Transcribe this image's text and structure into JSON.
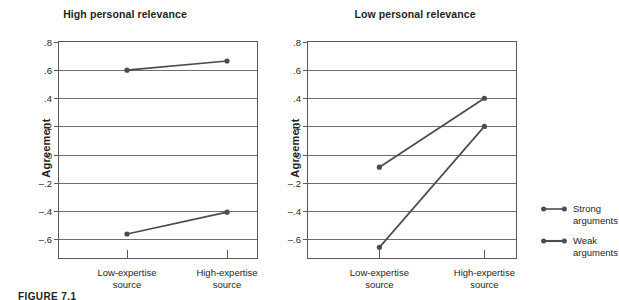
{
  "figure": {
    "caption_label": "FIGURE 7.1"
  },
  "legend": {
    "position": "right",
    "items": [
      {
        "label_line1": "Strong",
        "label_line2": "arguments",
        "name": "Strong arguments",
        "color": "#4a4a52"
      },
      {
        "label_line1": "Weak",
        "label_line2": "arguments",
        "name": "Weak arguments",
        "color": "#4a4a52"
      }
    ]
  },
  "colors": {
    "series": "#4a4a52",
    "frame": "#58595b",
    "gridline": "#6d6e71",
    "text": "#231f20",
    "background": "#ffffff"
  },
  "chart_data": [
    {
      "type": "line",
      "title": "High personal relevance",
      "xlabel": "",
      "ylabel": "Agreement",
      "categories": [
        "Low-expertise\nsource",
        "High-expertise\nsource"
      ],
      "category_labels": [
        {
          "line1": "Low-expertise",
          "line2": "source"
        },
        {
          "line1": "High-expertise",
          "line2": "source"
        }
      ],
      "ylim": [
        -0.75,
        0.8
      ],
      "yticks": [
        0.8,
        0.6,
        0.4,
        0.2,
        0,
        -0.2,
        -0.4,
        -0.6
      ],
      "ytick_labels": [
        ".8",
        ".6",
        ".4",
        ".2",
        "0",
        "–.2",
        "–.4",
        "–.6"
      ],
      "grid": true,
      "legend": "external-right",
      "series": [
        {
          "name": "Strong arguments",
          "values": [
            0.6,
            0.665
          ]
        },
        {
          "name": "Weak arguments",
          "values": [
            -0.565,
            -0.41
          ]
        }
      ]
    },
    {
      "type": "line",
      "title": "Low personal relevance",
      "xlabel": "",
      "ylabel": "Agreement",
      "categories": [
        "Low-expertise\nsource",
        "High-expertise\nsource"
      ],
      "category_labels": [
        {
          "line1": "Low-expertise",
          "line2": "source"
        },
        {
          "line1": "High-expertise",
          "line2": "source"
        }
      ],
      "ylim": [
        -0.75,
        0.8
      ],
      "yticks": [
        0.8,
        0.6,
        0.4,
        0.2,
        0,
        -0.2,
        -0.4,
        -0.6
      ],
      "ytick_labels": [
        ".8",
        ".6",
        ".4",
        ".2",
        "0",
        "–.2",
        "–.4",
        "–.6"
      ],
      "grid": true,
      "legend": "external-right",
      "series": [
        {
          "name": "Strong arguments",
          "values": [
            -0.09,
            0.4
          ]
        },
        {
          "name": "Weak arguments",
          "values": [
            -0.66,
            0.2
          ]
        }
      ]
    }
  ]
}
